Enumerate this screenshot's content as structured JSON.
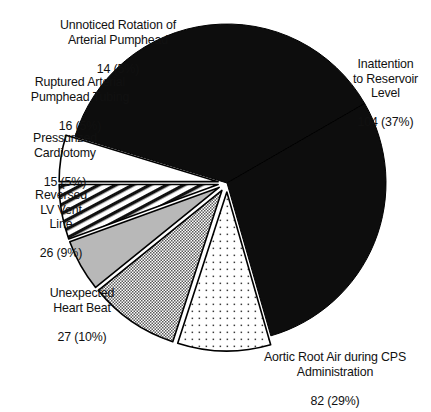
{
  "figure": {
    "background_color": "#ffffff",
    "outline_color": "#000000"
  },
  "chart_data": {
    "type": "pie",
    "title": "",
    "subtitle": "",
    "xlabel": "",
    "ylabel": "",
    "legend_position": "none",
    "grid": false,
    "total": 284,
    "units": "cases",
    "categories": [
      "Inattention to Reservoir Level",
      "Aortic Root Air during CPS Administration",
      "Unexpected Heart Beat",
      "Reversed LV Vent Line",
      "Pressurized Cardiotomy",
      "Ruptured Arterial Pumphead Tubing",
      "Unnoticed Rotation of Arterial Pumphead"
    ],
    "values": [
      104,
      82,
      27,
      26,
      15,
      16,
      14
    ],
    "percents": [
      37,
      29,
      10,
      9,
      5,
      5,
      5
    ],
    "slices": [
      {
        "label": "Inattention to Reservoir Level",
        "label_lines": [
          "Inattention",
          "to Reservoir",
          "Level"
        ],
        "value": 104,
        "percent": 37,
        "value_text": "104 (37%)",
        "fill": "#0d0d0d",
        "pattern": "solid-black",
        "exploded": false,
        "start_angle_deg": -73,
        "end_angle_deg": 60
      },
      {
        "label": "Aortic Root Air during CPS Administration",
        "label_lines": [
          "Aortic Root Air during CPS",
          "Administration"
        ],
        "value": 82,
        "percent": 29,
        "value_text": "82 (29%)",
        "fill": "#0d0d0d",
        "pattern": "solid-black",
        "exploded": false,
        "start_angle_deg": 60,
        "end_angle_deg": 164
      },
      {
        "label": "Unexpected Heart Beat",
        "label_lines": [
          "Unexpected",
          "Heart Beat"
        ],
        "value": 27,
        "percent": 10,
        "value_text": "27 (10%)",
        "fill": "#ffffff",
        "pattern": "sparse-dots",
        "exploded": true,
        "start_angle_deg": 164,
        "end_angle_deg": 198
      },
      {
        "label": "Reversed LV Vent Line",
        "label_lines": [
          "Reversed",
          "LV Vent",
          "Line"
        ],
        "value": 26,
        "percent": 9,
        "value_text": "26 (9%)",
        "fill": "#ffffff",
        "pattern": "fine-crosshatch",
        "exploded": true,
        "start_angle_deg": 198,
        "end_angle_deg": 231
      },
      {
        "label": "Pressurized Cardiotomy",
        "label_lines": [
          "Pressurized",
          "Cardiotomy"
        ],
        "value": 15,
        "percent": 5,
        "value_text": "15 (5%)",
        "fill": "#b8b8b8",
        "pattern": "solid-gray",
        "exploded": true,
        "start_angle_deg": 231,
        "end_angle_deg": 250
      },
      {
        "label": "Ruptured Arterial Pumphead Tubing",
        "label_lines": [
          "Ruptured Arterial",
          "Pumphead Tubing"
        ],
        "value": 16,
        "percent": 5,
        "value_text": "16 (5%)",
        "fill": "#ffffff",
        "pattern": "diagonal-stripes",
        "exploded": true,
        "start_angle_deg": 250,
        "end_angle_deg": 270
      },
      {
        "label": "Unnoticed Rotation of Arterial Pumphead",
        "label_lines": [
          "Unnoticed Rotation of",
          "Arterial Pumphead"
        ],
        "value": 14,
        "percent": 5,
        "value_text": "14 (5%)",
        "fill": "#ffffff",
        "pattern": "plain-white",
        "exploded": true,
        "start_angle_deg": 270,
        "end_angle_deg": 287
      }
    ]
  },
  "labels": {
    "unnoticed": {
      "text": "Unnoticed Rotation of\nArterial Pumphead",
      "value_text": "14 (5%)"
    },
    "ruptured": {
      "text": "Ruptured Arterial\nPumphead Tubing",
      "value_text": "16 (5%)"
    },
    "pressurized": {
      "text": "Pressurized\nCardiotomy",
      "value_text": "15 (5%)"
    },
    "reversed": {
      "text": "Reversed\nLV Vent\nLine",
      "value_text": "26 (9%)"
    },
    "unexpected": {
      "text": "Unexpected\nHeart Beat",
      "value_text": "27 (10%)"
    },
    "aortic": {
      "text": "Aortic Root Air during CPS\nAdministration",
      "value_text": "82 (29%)"
    },
    "inattention": {
      "text": "Inattention\nto Reservoir\nLevel",
      "value_text": "104 (37%)"
    }
  }
}
